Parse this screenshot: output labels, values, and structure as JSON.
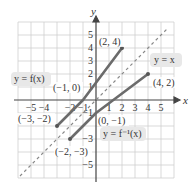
{
  "diagram": {
    "type": "function-and-inverse-graph",
    "grid": {
      "xmin": -6,
      "xmax": 6,
      "ymin": -6,
      "ymax": 6,
      "unit_px": 13,
      "origin_px": [
        96,
        100
      ]
    },
    "axes": {
      "x_label": "x",
      "y_label": "y",
      "x_ticks": [
        {
          "value": -5,
          "label": "−5"
        },
        {
          "value": -4,
          "label": "−4"
        },
        {
          "value": -2,
          "label": "−2"
        },
        {
          "value": -1,
          "label": "−1"
        },
        {
          "value": 1,
          "label": "1"
        },
        {
          "value": 2,
          "label": "2"
        },
        {
          "value": 3,
          "label": "3"
        },
        {
          "value": 4,
          "label": "4"
        },
        {
          "value": 5,
          "label": "5"
        }
      ],
      "y_ticks": [
        {
          "value": 5,
          "label": "5"
        },
        {
          "value": 4,
          "label": "4"
        },
        {
          "value": 3,
          "label": "3"
        },
        {
          "value": 2,
          "label": "2"
        },
        {
          "value": 1,
          "label": "1"
        },
        {
          "value": -1,
          "label": "−1"
        },
        {
          "value": -3,
          "label": "−3"
        },
        {
          "value": -5,
          "label": "−5"
        }
      ]
    },
    "curves": {
      "f": {
        "label": "y = f(x)",
        "segments": [
          [
            -3,
            -2
          ],
          [
            -1,
            0
          ],
          [
            2,
            4
          ]
        ],
        "color": "#666666"
      },
      "f_inverse": {
        "label": "y = f⁻¹(x)",
        "segments": [
          [
            -2,
            -3
          ],
          [
            0,
            -1
          ],
          [
            4,
            2
          ]
        ],
        "color": "#666666"
      },
      "identity": {
        "label": "y = x",
        "from": [
          -5.5,
          -5.5
        ],
        "to": [
          5.5,
          5.5
        ],
        "style": "dashed",
        "color": "#888888"
      }
    },
    "points": [
      {
        "label": "(2, 4)",
        "x": 2,
        "y": 4
      },
      {
        "label": "(4, 2)",
        "x": 4,
        "y": 2
      },
      {
        "label": "(−1, 0)",
        "x": -1,
        "y": 0
      },
      {
        "label": "(0, −1)",
        "x": 0,
        "y": -1
      },
      {
        "label": "(−3, −2)",
        "x": -3,
        "y": -2
      },
      {
        "label": "(−2, −3)",
        "x": -2,
        "y": -3
      }
    ]
  }
}
